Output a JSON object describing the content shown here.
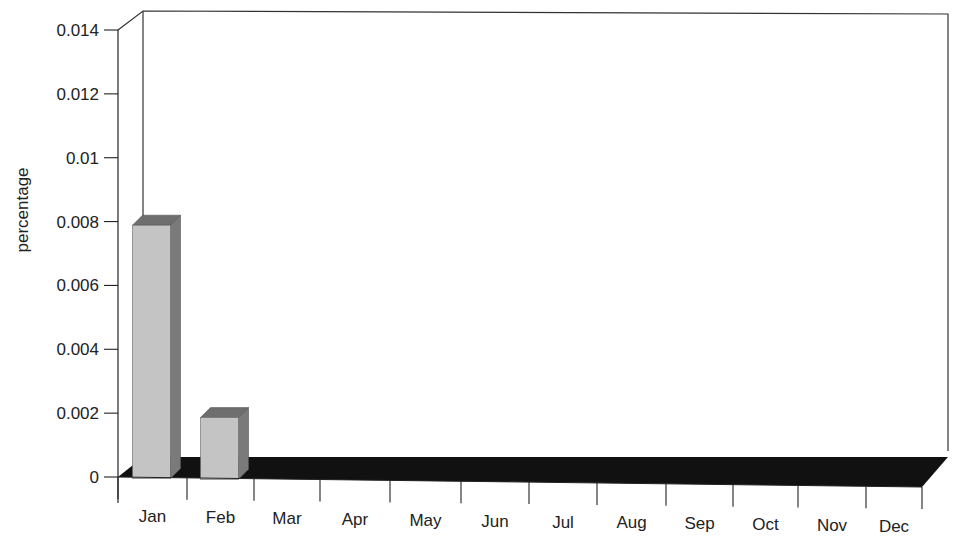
{
  "chart_data": {
    "type": "bar",
    "style": "3d",
    "title": "",
    "xlabel": "",
    "ylabel": "percentage",
    "ylim": [
      0,
      0.014
    ],
    "yticks": [
      0,
      0.002,
      0.004,
      0.006,
      0.008,
      0.01,
      0.012,
      0.014
    ],
    "ytick_labels": [
      "0",
      "0.002",
      "0.004",
      "0.006",
      "0.008",
      "0.01",
      "0.012",
      "0.014"
    ],
    "categories": [
      "Jan",
      "Feb",
      "Mar",
      "Apr",
      "May",
      "Jun",
      "Jul",
      "Aug",
      "Sep",
      "Oct",
      "Nov",
      "Dec"
    ],
    "values": [
      0.0079,
      0.0019,
      0,
      0,
      0,
      0,
      0,
      0,
      0,
      0,
      0,
      0
    ],
    "grid": false,
    "legend": null,
    "colors": {
      "bar_face": "#c4c4c4",
      "bar_side": "#7a7a7a",
      "bar_top": "#6e6e6e",
      "floor": "#111111",
      "wall_line": "#333333"
    }
  }
}
